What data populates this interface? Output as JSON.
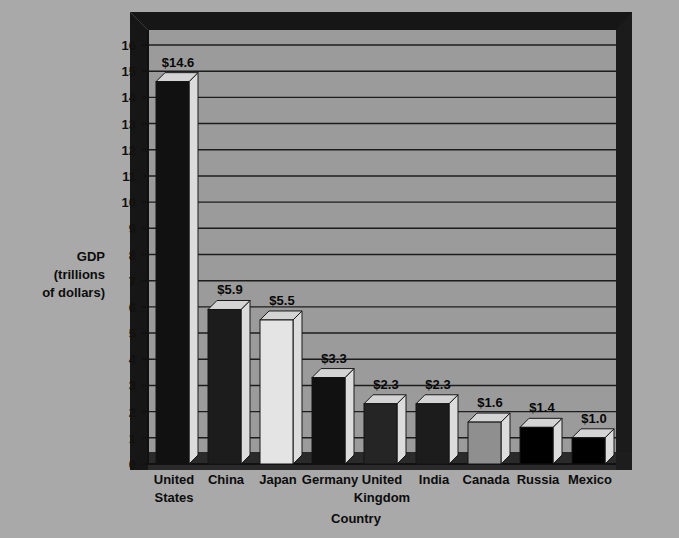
{
  "chart_data": {
    "type": "bar",
    "title": "",
    "xlabel": "Country",
    "ylabel": "GDP (trillions of dollars)",
    "ylabel_lines": [
      "GDP",
      "(trillions",
      "of dollars)"
    ],
    "categories": [
      "United States",
      "China",
      "Japan",
      "Germany",
      "United Kingdom",
      "India",
      "Canada",
      "Russia",
      "Mexico"
    ],
    "category_lines": [
      [
        "United",
        "States"
      ],
      [
        "China"
      ],
      [
        "Japan"
      ],
      [
        "Germany"
      ],
      [
        "United",
        "Kingdom"
      ],
      [
        "India"
      ],
      [
        "Canada"
      ],
      [
        "Russia"
      ],
      [
        "Mexico"
      ]
    ],
    "values": [
      14.6,
      5.9,
      5.5,
      3.3,
      2.3,
      2.3,
      1.6,
      1.4,
      1.0
    ],
    "value_labels": [
      "$14.6",
      "$5.9",
      "$5.5",
      "$3.3",
      "$2.3",
      "$2.3",
      "$1.6",
      "$1.4",
      "$1.0"
    ],
    "bar_fills": [
      "#111111",
      "#1c1c1c",
      "#e4e4e4",
      "#111111",
      "#252525",
      "#1c1c1c",
      "#8f8f8f",
      "#000000",
      "#000000"
    ],
    "ylim": [
      0,
      16
    ],
    "ytick_labels": [
      "0",
      "1",
      "2",
      "3",
      "4",
      "5",
      "6",
      "7",
      "8",
      "9",
      "10",
      "11",
      "12",
      "13",
      "14",
      "15",
      "16"
    ],
    "ytick_values": [
      0,
      1,
      2,
      3,
      4,
      5,
      6,
      7,
      8,
      9,
      10,
      11,
      12,
      13,
      14,
      15,
      16
    ],
    "grid": true,
    "legend": "none",
    "style": "3d-bars",
    "colors": {
      "page_background": "#a9a9a9",
      "plot_background": "#9a9a9a",
      "frame": "#1a1a1a",
      "gridline": "#1d1d1d",
      "floor": "#3a3a3a",
      "bar_side": "#dcdcdc",
      "bar_top": "#d4d4d4"
    }
  }
}
